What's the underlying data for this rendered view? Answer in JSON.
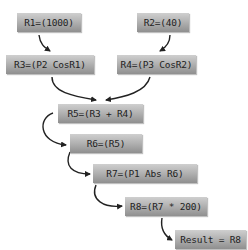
{
  "diagram": {
    "nodes": [
      {
        "id": "r1",
        "label": "R1=(1000)"
      },
      {
        "id": "r2",
        "label": "R2=(40)"
      },
      {
        "id": "r3",
        "label": "R3=(P2 CosR1)"
      },
      {
        "id": "r4",
        "label": "R4=(P3 CosR2)"
      },
      {
        "id": "r5",
        "label": "R5=(R3 + R4)"
      },
      {
        "id": "r6",
        "label": "R6=(R5)"
      },
      {
        "id": "r7",
        "label": "R7=(P1 Abs R6)"
      },
      {
        "id": "r8",
        "label": "R8=(R7 * 200)"
      },
      {
        "id": "result",
        "label": "Result = R8"
      }
    ],
    "edges": [
      {
        "from": "r1",
        "to": "r3"
      },
      {
        "from": "r2",
        "to": "r4"
      },
      {
        "from": "r3",
        "to": "r5"
      },
      {
        "from": "r4",
        "to": "r5"
      },
      {
        "from": "r5",
        "to": "r6"
      },
      {
        "from": "r6",
        "to": "r7"
      },
      {
        "from": "r7",
        "to": "r8"
      },
      {
        "from": "r8",
        "to": "result"
      }
    ],
    "colors": {
      "node_top": "#cfcfcf",
      "node_bottom": "#8f8f8f",
      "text": "#1e1e1e",
      "arrow": "#222222",
      "background": "#ffffff"
    }
  }
}
